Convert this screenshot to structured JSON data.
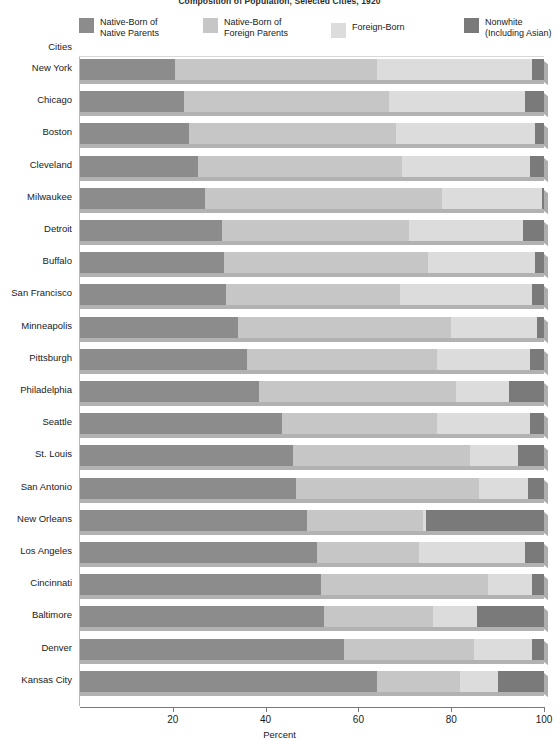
{
  "chart_data": {
    "type": "bar",
    "orientation": "horizontal",
    "stacked": true,
    "title": "Composition of Population, Selected Cities, 1920",
    "xlabel": "Percent",
    "ylabel": "Cities",
    "xlim": [
      0,
      100
    ],
    "xticks": [
      20,
      40,
      60,
      80,
      100
    ],
    "grid": false,
    "legend_position": "top",
    "categories": [
      "New York",
      "Chicago",
      "Boston",
      "Cleveland",
      "Milwaukee",
      "Detroit",
      "Buffalo",
      "San Francisco",
      "Minneapolis",
      "Pittsburgh",
      "Philadelphia",
      "Seattle",
      "St. Louis",
      "San Antonio",
      "New Orleans",
      "Los Angeles",
      "Cincinnati",
      "Baltimore",
      "Denver",
      "Kansas City"
    ],
    "series": [
      {
        "name": "Native-Born of Native Parents",
        "color": "#8c8c8c",
        "values": [
          20.5,
          22.5,
          23.5,
          25.5,
          27.0,
          30.5,
          31.0,
          31.5,
          34.0,
          36.0,
          38.5,
          43.5,
          46.0,
          46.5,
          49.0,
          51.0,
          52.0,
          52.5,
          57.0,
          64.0
        ]
      },
      {
        "name": "Native-Born of Foreign Parents",
        "color": "#c6c6c6",
        "values": [
          43.5,
          44.0,
          44.5,
          44.0,
          51.0,
          40.5,
          44.0,
          37.5,
          46.0,
          41.0,
          42.5,
          33.5,
          38.0,
          39.5,
          25.0,
          22.0,
          36.0,
          23.5,
          28.0,
          18.0
        ]
      },
      {
        "name": "Foreign-Born",
        "color": "#dcdcdc",
        "values": [
          33.5,
          29.5,
          30.0,
          27.5,
          21.5,
          24.5,
          23.0,
          28.5,
          18.5,
          20.0,
          11.5,
          20.0,
          10.5,
          10.5,
          0.5,
          23.0,
          9.5,
          9.5,
          12.5,
          8.0
        ]
      },
      {
        "name": "Nonwhite (Including Asian)",
        "color": "#7a7a7a",
        "values": [
          2.5,
          4.0,
          2.0,
          3.0,
          0.5,
          4.5,
          2.0,
          2.5,
          1.5,
          3.0,
          7.5,
          3.0,
          5.5,
          3.5,
          25.5,
          4.0,
          2.5,
          14.5,
          2.5,
          10.0
        ]
      }
    ]
  },
  "legend": {
    "items": [
      {
        "label": "Native-Born of\nNative Parents",
        "color": "#8c8c8c",
        "icon": "legend-swatch-icon"
      },
      {
        "label": "Native-Born of\nForeign Parents",
        "color": "#c6c6c6",
        "icon": "legend-swatch-icon"
      },
      {
        "label": "Foreign-Born",
        "color": "#dcdcdc",
        "icon": "legend-swatch-icon"
      },
      {
        "label": "Nonwhite\n(Including Asian)",
        "color": "#7a7a7a",
        "icon": "legend-swatch-icon"
      }
    ]
  },
  "axes": {
    "y_axis_title": "Cities",
    "x_axis_title": "Percent",
    "x_tick_labels": [
      "20",
      "40",
      "60",
      "80",
      "100"
    ]
  }
}
